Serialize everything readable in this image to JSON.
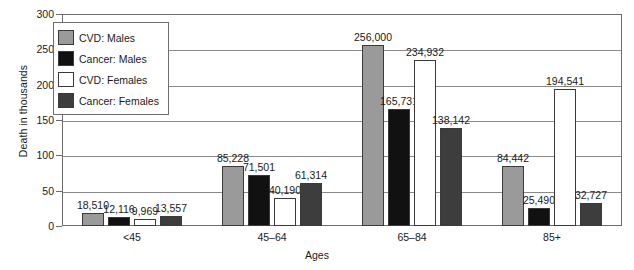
{
  "chart_data": {
    "type": "bar",
    "title": "",
    "xlabel": "Ages",
    "ylabel": "Death in thousands",
    "categories": [
      "<45",
      "45–64",
      "65–84",
      "85+"
    ],
    "ylim": [
      0,
      300
    ],
    "yticks": [
      0,
      50,
      100,
      150,
      200,
      250,
      300
    ],
    "ytick_labels": [
      "0",
      "50",
      "100",
      "150",
      "200",
      "250",
      "300"
    ],
    "grid": true,
    "legend_position": "upper-left-inside",
    "units": "deaths (values labeled in units, axis in thousands)",
    "series": [
      {
        "name": "CVD: Males",
        "color": "#9a9a9a",
        "values": [
          18510,
          85228,
          256000,
          84442
        ],
        "labels": [
          "18,510",
          "85,228",
          "256,000",
          "84,442"
        ]
      },
      {
        "name": "Cancer: Males",
        "color": "#111111",
        "values": [
          12116,
          71501,
          165731,
          25490
        ],
        "labels": [
          "12,116",
          "71,501",
          "165,731",
          "25,490"
        ]
      },
      {
        "name": "CVD: Females",
        "color": "#ffffff",
        "values": [
          9969,
          40190,
          234932,
          194541
        ],
        "labels": [
          "9,969",
          "40,190",
          "234,932",
          "194,541"
        ]
      },
      {
        "name": "Cancer: Females",
        "color": "#3d3d3d",
        "values": [
          13557,
          61314,
          138142,
          32727
        ],
        "labels": [
          "13,557",
          "61,314",
          "138,142",
          "32,727"
        ]
      }
    ]
  },
  "colors": {
    "axis": "#6d6d6d",
    "grid": "#8a8a8a",
    "bar_outline": "#3a3a3a",
    "text": "#1a1a1a",
    "background": "#ffffff"
  }
}
